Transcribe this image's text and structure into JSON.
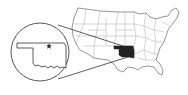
{
  "map": {
    "title": "",
    "highlighted_region": "Oklahoma",
    "base_region": "Contiguous United States",
    "inset_marker": "star",
    "colors": {
      "background": "#ffffff",
      "outline": "#555555",
      "highlight": "#222222",
      "state_borders": "#9a9a9a"
    }
  }
}
